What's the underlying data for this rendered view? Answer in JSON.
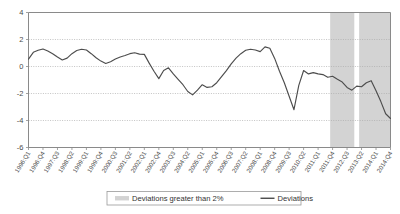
{
  "chart_data": {
    "type": "line",
    "title": "",
    "xlabel": "",
    "ylabel": "",
    "ylim": [
      -6,
      4
    ],
    "yticks": [
      4,
      2,
      0,
      -2,
      -4,
      -6
    ],
    "ytick_labels": [
      "4",
      "2",
      "0",
      "-2",
      "-4",
      "-6"
    ],
    "grid": true,
    "legend_position": "bottom-center",
    "xtick_labels": [
      "1996:Q1",
      "1996:Q4",
      "1997:Q3",
      "1998:Q2",
      "1999:Q1",
      "1999:Q4",
      "2000:Q3",
      "2001:Q2",
      "2002:Q1",
      "2002:Q4",
      "2003:Q3",
      "2004:Q2",
      "2005:Q1",
      "2005:Q4",
      "2006:Q3",
      "2007:Q2",
      "2008:Q1",
      "2008:Q4",
      "2009:Q3",
      "2010:Q2",
      "2011:Q1",
      "2011:Q4",
      "2012:Q3",
      "2013:Q2",
      "2014:Q1",
      "2014:Q4"
    ],
    "xtick_indices": [
      0,
      3,
      6,
      9,
      12,
      15,
      18,
      21,
      24,
      27,
      30,
      33,
      36,
      39,
      42,
      45,
      48,
      51,
      54,
      57,
      60,
      63,
      66,
      69,
      72,
      75
    ],
    "series": [
      {
        "name": "Deviations",
        "color": "#4d4d4d",
        "x": [
          "1996:Q1",
          "1996:Q2",
          "1996:Q3",
          "1996:Q4",
          "1997:Q1",
          "1997:Q2",
          "1997:Q3",
          "1997:Q4",
          "1998:Q1",
          "1998:Q2",
          "1998:Q3",
          "1998:Q4",
          "1999:Q1",
          "1999:Q2",
          "1999:Q3",
          "1999:Q4",
          "2000:Q1",
          "2000:Q2",
          "2000:Q3",
          "2000:Q4",
          "2001:Q1",
          "2001:Q2",
          "2001:Q3",
          "2001:Q4",
          "2002:Q1",
          "2002:Q2",
          "2002:Q3",
          "2002:Q4",
          "2003:Q1",
          "2003:Q2",
          "2003:Q3",
          "2003:Q4",
          "2004:Q1",
          "2004:Q2",
          "2004:Q3",
          "2004:Q4",
          "2005:Q1",
          "2005:Q2",
          "2005:Q3",
          "2005:Q4",
          "2006:Q1",
          "2006:Q2",
          "2006:Q3",
          "2006:Q4",
          "2007:Q1",
          "2007:Q2",
          "2007:Q3",
          "2007:Q4",
          "2008:Q1",
          "2008:Q2",
          "2008:Q3",
          "2008:Q4",
          "2009:Q1",
          "2009:Q2",
          "2009:Q3",
          "2009:Q4",
          "2010:Q1",
          "2010:Q2",
          "2010:Q3",
          "2010:Q4",
          "2011:Q1",
          "2011:Q2",
          "2011:Q3",
          "2011:Q4",
          "2012:Q1",
          "2012:Q2",
          "2012:Q3",
          "2012:Q4",
          "2013:Q1",
          "2013:Q2",
          "2013:Q3",
          "2013:Q4",
          "2014:Q1",
          "2014:Q2",
          "2014:Q3",
          "2014:Q4"
        ],
        "values": [
          0.55,
          1.05,
          1.2,
          1.3,
          1.15,
          0.95,
          0.7,
          0.48,
          0.62,
          0.95,
          1.18,
          1.28,
          1.22,
          0.95,
          0.65,
          0.4,
          0.22,
          0.35,
          0.55,
          0.7,
          0.82,
          0.95,
          1.02,
          0.92,
          0.9,
          0.25,
          -0.35,
          -0.9,
          -0.3,
          -0.1,
          -0.55,
          -0.95,
          -1.35,
          -1.85,
          -2.1,
          -1.75,
          -1.35,
          -1.55,
          -1.5,
          -1.2,
          -0.75,
          -0.3,
          0.2,
          0.62,
          0.95,
          1.2,
          1.28,
          1.22,
          1.1,
          1.45,
          1.35,
          0.6,
          -0.35,
          -1.2,
          -2.2,
          -3.2,
          -1.4,
          -0.3,
          -0.55,
          -0.45,
          -0.55,
          -0.6,
          -0.8,
          -0.72,
          -0.95,
          -1.15,
          -1.55,
          -1.75,
          -1.45,
          -1.5,
          -1.2,
          -1.05,
          -1.8,
          -2.6,
          -3.5,
          -3.85
        ]
      }
    ],
    "bands": [
      {
        "label": "Deviations greater than 2%",
        "start": "2011:Q4",
        "end": "2012:Q4",
        "color": "#d3d3d3"
      },
      {
        "label": "Deviations greater than 2%",
        "start": "2013:Q2",
        "end": "2014:Q4",
        "color": "#d3d3d3"
      }
    ],
    "legend": [
      {
        "label": "Deviations greater than 2%",
        "type": "band",
        "color": "#d3d3d3"
      },
      {
        "label": "Deviations",
        "type": "line",
        "color": "#3c3c3c"
      }
    ]
  }
}
